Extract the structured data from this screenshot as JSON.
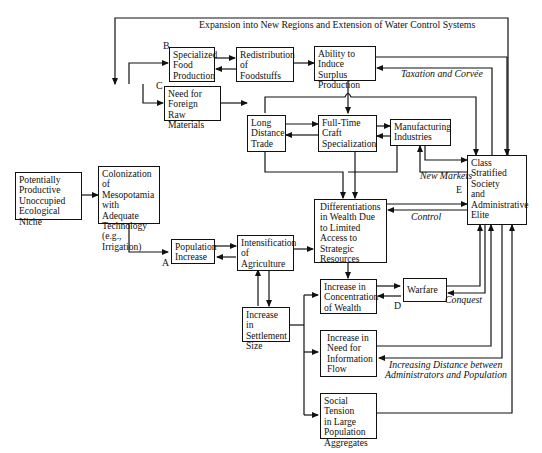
{
  "diagram": {
    "nodes": {
      "niche": "Potentially\nProductive\nUnoccupied\nEcological Niche",
      "colonization": "Colonization\nof Mesopotamia\nwith Adequate\nTechnology\n(e.g., Irrigation)",
      "specialized_food": "Specialized\nFood\nProduction",
      "redistribution": "Redistribution\nof\nFoodstuffs",
      "surplus": "Ability to\nInduce Surplus\nProduction",
      "foreign_raw": "Need for\nForeign Raw\nMaterials",
      "long_trade": "Long\nDistance\nTrade",
      "craft": "Full-Time\nCraft\nSpecialization",
      "manufacturing": "Manufacturing\nIndustries",
      "class_society": "Class\nStratified\nSociety\nand\nAdministrative\nElite",
      "population": "Population\nIncrease",
      "intensification": "Intensification\nof\nAgriculture",
      "differentiations": "Differentiations\nin Wealth Due\nto Limited\nAccess to\nStrategic\nResources",
      "settlement": "Increase in\nSettlement\nSize",
      "concentration": "Increase in\nConcentration\nof Wealth",
      "warfare": "Warfare",
      "information": "Increase in\nNeed for\nInformation\nFlow",
      "social_tension": "Social Tension\nin Large\nPopulation\nAggregates"
    },
    "edge_labels": {
      "expansion": "Expansion into New Regions and Extension of Water Control Systems",
      "taxation": "Taxation and Corvée",
      "new_markets": "New Markets",
      "control": "Control",
      "conquest": "Conquest",
      "distance_line1": "Increasing Distance between",
      "distance_line2": "Administrators and Population"
    },
    "markers": {
      "a": "A",
      "b": "B",
      "c": "C",
      "d": "D",
      "e": "E"
    }
  }
}
